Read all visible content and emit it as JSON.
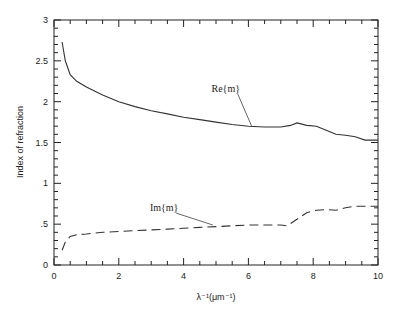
{
  "chart_data": {
    "type": "line",
    "title": "",
    "xlabel": "λ⁻¹(μm⁻¹)",
    "ylabel": "Index of refraction",
    "xlim": [
      0,
      10
    ],
    "ylim": [
      0,
      3
    ],
    "grid": false,
    "legend": "inline annotations",
    "xticks": [
      "0",
      "2",
      "4",
      "6",
      "8",
      "10"
    ],
    "yticks": [
      "0",
      ".5",
      "1",
      "1.5",
      "2",
      "2.5",
      "3"
    ],
    "series": [
      {
        "name": "Re{m}",
        "style": "solid",
        "x": [
          0.25,
          0.35,
          0.5,
          0.7,
          1.0,
          1.5,
          2.0,
          2.5,
          3.0,
          3.5,
          4.0,
          4.5,
          5.0,
          5.5,
          6.0,
          6.5,
          7.0,
          7.3,
          7.5,
          7.8,
          8.1,
          8.4,
          8.7,
          9.0,
          9.3,
          9.6,
          10.0
        ],
        "y": [
          2.73,
          2.5,
          2.33,
          2.25,
          2.18,
          2.08,
          2.0,
          1.94,
          1.89,
          1.85,
          1.81,
          1.78,
          1.75,
          1.72,
          1.7,
          1.69,
          1.69,
          1.71,
          1.74,
          1.71,
          1.7,
          1.65,
          1.6,
          1.59,
          1.57,
          1.53,
          1.53
        ]
      },
      {
        "name": "Im{m}",
        "style": "dashed",
        "x": [
          0.25,
          0.35,
          0.5,
          0.7,
          1.0,
          1.5,
          2.0,
          2.5,
          3.0,
          3.5,
          4.0,
          4.5,
          5.0,
          5.5,
          6.0,
          6.5,
          7.0,
          7.2,
          7.5,
          7.8,
          8.1,
          8.4,
          8.7,
          9.0,
          9.3,
          9.6,
          10.0
        ],
        "y": [
          0.18,
          0.28,
          0.35,
          0.37,
          0.38,
          0.4,
          0.41,
          0.42,
          0.43,
          0.44,
          0.45,
          0.46,
          0.47,
          0.48,
          0.49,
          0.49,
          0.49,
          0.48,
          0.56,
          0.64,
          0.67,
          0.68,
          0.67,
          0.7,
          0.72,
          0.72,
          0.72
        ]
      }
    ],
    "annotations": [
      {
        "text": "Re{m}",
        "text_x": 5.3,
        "text_y": 2.12,
        "arrow_to": [
          6.1,
          1.7
        ]
      },
      {
        "text": "Im{m}",
        "text_x": 3.4,
        "text_y": 0.66,
        "arrow_to": [
          4.9,
          0.49
        ]
      }
    ]
  }
}
